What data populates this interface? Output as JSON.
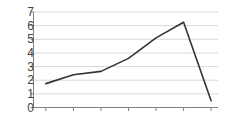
{
  "chart_data": {
    "type": "line",
    "title": "",
    "subtitle": "",
    "xlabel": "",
    "ylabel": "",
    "x": [
      1,
      2,
      3,
      4,
      5,
      6,
      7
    ],
    "series": [
      {
        "name": "series-1",
        "values": [
          1.75,
          2.4,
          2.65,
          3.6,
          5.1,
          6.25,
          0.5
        ]
      }
    ],
    "ylim": [
      0,
      7
    ],
    "xlim": [
      0.55,
      7.25
    ],
    "ytick_labels": [
      "7",
      "6",
      "5",
      "4",
      "3",
      "2",
      "1",
      "0"
    ],
    "ytick_values": [
      7,
      6,
      5,
      4,
      3,
      2,
      1,
      0
    ],
    "xtick_labels": [
      "",
      "",
      "",
      "",
      "",
      "",
      ""
    ],
    "xtick_count": 7,
    "grid": true,
    "grid_axis": "y",
    "legend": false,
    "legend_position": "none",
    "annotations": []
  },
  "style": {
    "line_color": "#333333",
    "grid_color": "#d9d9d9",
    "axis_color": "#808080",
    "tick_color": "#808080",
    "background_color": "#ffffff",
    "label_color": "#444444"
  }
}
